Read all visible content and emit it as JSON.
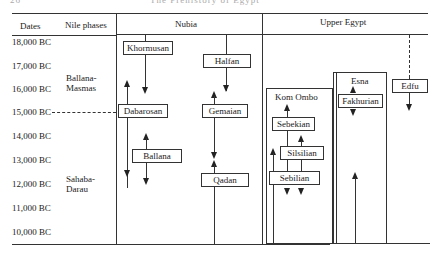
{
  "running_head": {
    "page": "26",
    "title": "The Prehistory of Egypt"
  },
  "header": {
    "dates": "Dates",
    "nile_phases": "Nile phases",
    "nubia": "Nubia",
    "upper_egypt": "Upper Egypt"
  },
  "dates": [
    "18,000 BC",
    "17,000 BC",
    "16,000 BC",
    "15,000 BC",
    "14,000 BC",
    "13,000 BC",
    "12,000 BC",
    "11,000 BC",
    "10,000 BC"
  ],
  "nile_phases": [
    {
      "line1": "Ballana-",
      "line2": "Masmas"
    },
    {
      "line1": "Sahaba-",
      "line2": "Darau"
    }
  ],
  "nubia": {
    "khormusan": "Khormusan",
    "halfan": "Halfan",
    "dabarosan": "Dabarosan",
    "gemaian": "Gemaian",
    "ballana": "Ballana",
    "qadan": "Qadan"
  },
  "upper_egypt": {
    "kom_ombo": "Kom Ombo",
    "sebekian": "Sebekian",
    "silsilian": "Silsilian",
    "sebilian": "Sebilian",
    "esna": "Esna",
    "fakhurian": "Fakhurian",
    "edfu": "Edfu"
  }
}
